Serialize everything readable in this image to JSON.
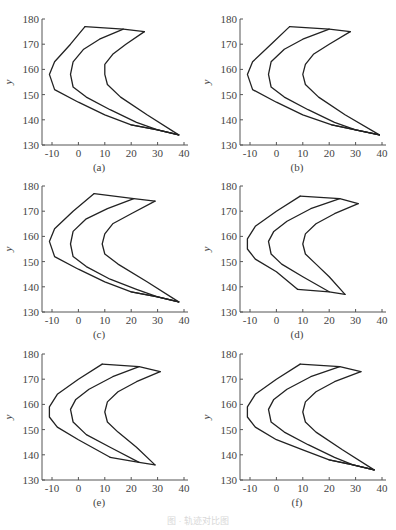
{
  "figure": {
    "caption": "图 · 轨迹对比图"
  },
  "chart_data": [
    {
      "type": "line",
      "label": "(a)",
      "xlabel": "x",
      "ylabel": "y",
      "xlim": [
        -15,
        40
      ],
      "ylim": [
        130,
        180
      ],
      "xticks": [
        -10,
        0,
        10,
        20,
        30,
        40
      ],
      "yticks": [
        130,
        140,
        150,
        160,
        170,
        180
      ],
      "grid": false,
      "series": [
        {
          "name": "outer",
          "points": [
            [
              2.5,
              177
            ],
            [
              17,
              176
            ],
            [
              25,
              175
            ]
          ]
        },
        {
          "name": "curve1",
          "points": [
            [
              2.5,
              177
            ],
            [
              -3,
              170
            ],
            [
              -9,
              163
            ],
            [
              -11,
              158
            ],
            [
              -9,
              152
            ],
            [
              0,
              147
            ],
            [
              10,
              142
            ],
            [
              20,
              138
            ],
            [
              30,
              136
            ],
            [
              38,
              134
            ]
          ]
        },
        {
          "name": "curve2",
          "points": [
            [
              17,
              176
            ],
            [
              8,
              172
            ],
            [
              2,
              168
            ],
            [
              -2,
              163
            ],
            [
              -3,
              158
            ],
            [
              -2,
              153
            ],
            [
              3,
              149
            ],
            [
              12,
              144
            ],
            [
              22,
              139
            ],
            [
              30,
              136
            ],
            [
              38,
              134
            ]
          ]
        },
        {
          "name": "curve3",
          "points": [
            [
              25,
              175
            ],
            [
              18,
              170
            ],
            [
              13,
              166
            ],
            [
              10,
              162
            ],
            [
              10,
              158
            ],
            [
              11,
              154
            ],
            [
              16,
              149
            ],
            [
              26,
              142
            ],
            [
              38,
              134
            ]
          ]
        },
        {
          "name": "bottom",
          "points": [
            [
              20,
              138
            ],
            [
              30,
              136
            ],
            [
              38,
              134
            ]
          ]
        }
      ]
    },
    {
      "type": "line",
      "label": "(b)",
      "xlabel": "x",
      "ylabel": "y",
      "xlim": [
        -15,
        40
      ],
      "ylim": [
        130,
        180
      ],
      "xticks": [
        -10,
        0,
        10,
        20,
        30,
        40
      ],
      "yticks": [
        130,
        140,
        150,
        160,
        170,
        180
      ],
      "grid": false,
      "series": [
        {
          "name": "outer",
          "points": [
            [
              5,
              177
            ],
            [
              20,
              176
            ],
            [
              28,
              175
            ]
          ]
        },
        {
          "name": "curve1",
          "points": [
            [
              5,
              177
            ],
            [
              -2,
              170
            ],
            [
              -9,
              163
            ],
            [
              -11,
              158
            ],
            [
              -9,
              152
            ],
            [
              0,
              147
            ],
            [
              10,
              142
            ],
            [
              21,
              138
            ],
            [
              30,
              136
            ],
            [
              39,
              134
            ]
          ]
        },
        {
          "name": "curve2",
          "points": [
            [
              20,
              176
            ],
            [
              10,
              172
            ],
            [
              3,
              168
            ],
            [
              -2,
              163
            ],
            [
              -3,
              158
            ],
            [
              -2,
              153
            ],
            [
              3,
              149
            ],
            [
              12,
              144
            ],
            [
              22,
              139
            ],
            [
              30,
              136
            ],
            [
              39,
              134
            ]
          ]
        },
        {
          "name": "curve3",
          "points": [
            [
              28,
              175
            ],
            [
              20,
              170
            ],
            [
              14,
              166
            ],
            [
              11,
              162
            ],
            [
              10,
              158
            ],
            [
              11,
              154
            ],
            [
              16,
              149
            ],
            [
              26,
              142
            ],
            [
              39,
              134
            ]
          ]
        },
        {
          "name": "bottom",
          "points": [
            [
              21,
              138
            ],
            [
              30,
              136
            ],
            [
              39,
              134
            ]
          ]
        }
      ]
    },
    {
      "type": "line",
      "label": "(c)",
      "xlabel": "x",
      "ylabel": "y",
      "xlim": [
        -15,
        40
      ],
      "ylim": [
        130,
        180
      ],
      "xticks": [
        -10,
        0,
        10,
        20,
        30,
        40
      ],
      "yticks": [
        130,
        140,
        150,
        160,
        170,
        180
      ],
      "grid": false,
      "series": [
        {
          "name": "outer",
          "points": [
            [
              6,
              177
            ],
            [
              21,
              175
            ],
            [
              29,
              174
            ]
          ]
        },
        {
          "name": "curve1",
          "points": [
            [
              6,
              177
            ],
            [
              -2,
              170
            ],
            [
              -9,
              163
            ],
            [
              -11,
              158
            ],
            [
              -9,
              152
            ],
            [
              0,
              147
            ],
            [
              10,
              142
            ],
            [
              20,
              138
            ],
            [
              30,
              136
            ],
            [
              38,
              134
            ]
          ]
        },
        {
          "name": "curve2",
          "points": [
            [
              21,
              175
            ],
            [
              11,
              171
            ],
            [
              3,
              167
            ],
            [
              -2,
              162
            ],
            [
              -3,
              157
            ],
            [
              -2,
              152
            ],
            [
              3,
              148
            ],
            [
              12,
              143
            ],
            [
              22,
              139
            ],
            [
              30,
              136
            ],
            [
              38,
              134
            ]
          ]
        },
        {
          "name": "curve3",
          "points": [
            [
              29,
              174
            ],
            [
              20,
              169
            ],
            [
              13,
              165
            ],
            [
              10,
              161
            ],
            [
              9,
              157
            ],
            [
              10,
              153
            ],
            [
              15,
              149
            ],
            [
              26,
              142
            ],
            [
              38,
              134
            ]
          ]
        },
        {
          "name": "bottom",
          "points": [
            [
              20,
              138
            ],
            [
              30,
              136
            ],
            [
              38,
              134
            ]
          ]
        }
      ]
    },
    {
      "type": "line",
      "label": "(d)",
      "xlabel": "x",
      "ylabel": "y",
      "xlim": [
        -15,
        40
      ],
      "ylim": [
        130,
        180
      ],
      "xticks": [
        -10,
        0,
        10,
        20,
        30,
        40
      ],
      "yticks": [
        130,
        140,
        150,
        160,
        170,
        180
      ],
      "grid": false,
      "series": [
        {
          "name": "outer",
          "points": [
            [
              9,
              176
            ],
            [
              24,
              175
            ],
            [
              31,
              173
            ]
          ]
        },
        {
          "name": "curve1",
          "points": [
            [
              9,
              176
            ],
            [
              0,
              170
            ],
            [
              -8,
              164
            ],
            [
              -11,
              159
            ],
            [
              -11,
              155
            ],
            [
              -8,
              151
            ],
            [
              0,
              146
            ],
            [
              8,
              139
            ]
          ]
        },
        {
          "name": "curve2",
          "points": [
            [
              24,
              175
            ],
            [
              13,
              171
            ],
            [
              4,
              166
            ],
            [
              -1,
              162
            ],
            [
              -3,
              158
            ],
            [
              -2,
              153
            ],
            [
              2,
              149
            ],
            [
              10,
              144
            ],
            [
              20,
              138
            ]
          ]
        },
        {
          "name": "curve3",
          "points": [
            [
              31,
              173
            ],
            [
              22,
              169
            ],
            [
              15,
              165
            ],
            [
              11,
              161
            ],
            [
              10,
              157
            ],
            [
              11,
              153
            ],
            [
              15,
              149
            ],
            [
              20,
              144
            ],
            [
              26,
              137
            ]
          ]
        },
        {
          "name": "bottom",
          "points": [
            [
              8,
              139
            ],
            [
              20,
              138
            ],
            [
              26,
              137
            ]
          ]
        }
      ]
    },
    {
      "type": "line",
      "label": "(e)",
      "xlabel": "x",
      "ylabel": "y",
      "xlim": [
        -15,
        40
      ],
      "ylim": [
        130,
        180
      ],
      "xticks": [
        -10,
        0,
        10,
        20,
        30,
        40
      ],
      "yticks": [
        130,
        140,
        150,
        160,
        170,
        180
      ],
      "grid": false,
      "series": [
        {
          "name": "outer",
          "points": [
            [
              9,
              176
            ],
            [
              23,
              175
            ],
            [
              31,
              173
            ]
          ]
        },
        {
          "name": "curve1",
          "points": [
            [
              9,
              176
            ],
            [
              0,
              170
            ],
            [
              -8,
              164
            ],
            [
              -11,
              159
            ],
            [
              -11,
              155
            ],
            [
              -8,
              151
            ],
            [
              0,
              146
            ],
            [
              12,
              139
            ]
          ]
        },
        {
          "name": "curve2",
          "points": [
            [
              23,
              175
            ],
            [
              13,
              171
            ],
            [
              4,
              166
            ],
            [
              -1,
              162
            ],
            [
              -3,
              158
            ],
            [
              -2,
              153
            ],
            [
              3,
              148
            ],
            [
              12,
              143
            ],
            [
              23,
              137
            ]
          ]
        },
        {
          "name": "curve3",
          "points": [
            [
              31,
              173
            ],
            [
              22,
              169
            ],
            [
              15,
              165
            ],
            [
              11,
              161
            ],
            [
              10,
              157
            ],
            [
              11,
              153
            ],
            [
              15,
              149
            ],
            [
              22,
              143
            ],
            [
              29,
              136
            ]
          ]
        },
        {
          "name": "bottom",
          "points": [
            [
              12,
              139
            ],
            [
              23,
              137
            ],
            [
              29,
              136
            ]
          ]
        }
      ]
    },
    {
      "type": "line",
      "label": "(f)",
      "xlabel": "x",
      "ylabel": "y",
      "xlim": [
        -15,
        40
      ],
      "ylim": [
        130,
        180
      ],
      "xticks": [
        -10,
        0,
        10,
        20,
        30,
        40
      ],
      "yticks": [
        130,
        140,
        150,
        160,
        170,
        180
      ],
      "grid": false,
      "series": [
        {
          "name": "outer",
          "points": [
            [
              9,
              176
            ],
            [
              24,
              175
            ],
            [
              32,
              173
            ]
          ]
        },
        {
          "name": "curve1",
          "points": [
            [
              9,
              176
            ],
            [
              0,
              170
            ],
            [
              -8,
              164
            ],
            [
              -11,
              159
            ],
            [
              -11,
              155
            ],
            [
              -8,
              151
            ],
            [
              0,
              146
            ],
            [
              10,
              142
            ],
            [
              20,
              138
            ],
            [
              29,
              136
            ],
            [
              37,
              134
            ]
          ]
        },
        {
          "name": "curve2",
          "points": [
            [
              24,
              175
            ],
            [
              13,
              171
            ],
            [
              4,
              166
            ],
            [
              -1,
              162
            ],
            [
              -3,
              158
            ],
            [
              -2,
              153
            ],
            [
              3,
              149
            ],
            [
              12,
              144
            ],
            [
              22,
              139
            ],
            [
              29,
              136
            ],
            [
              37,
              134
            ]
          ]
        },
        {
          "name": "curve3",
          "points": [
            [
              32,
              173
            ],
            [
              22,
              169
            ],
            [
              15,
              165
            ],
            [
              11,
              161
            ],
            [
              10,
              157
            ],
            [
              11,
              153
            ],
            [
              15,
              149
            ],
            [
              25,
              142
            ],
            [
              37,
              134
            ]
          ]
        },
        {
          "name": "bottom",
          "points": [
            [
              20,
              138
            ],
            [
              29,
              136
            ],
            [
              37,
              134
            ]
          ]
        }
      ]
    }
  ]
}
